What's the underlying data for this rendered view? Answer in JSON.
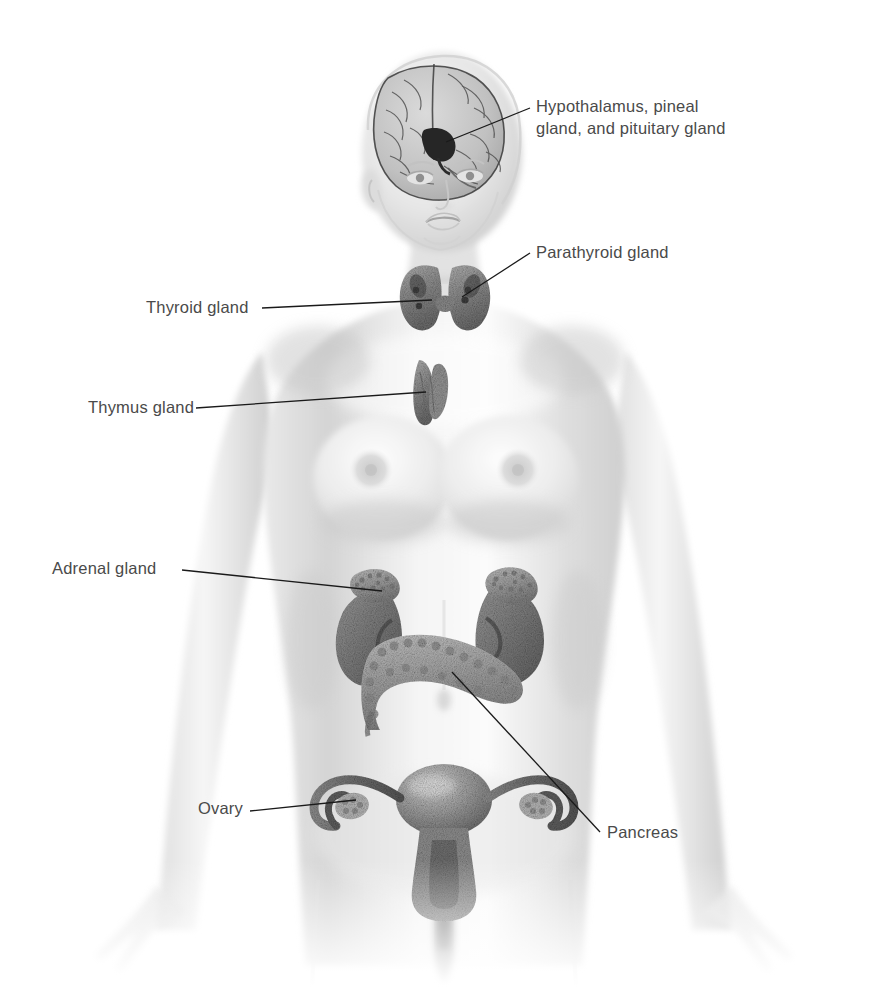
{
  "diagram": {
    "background_color": "#ffffff",
    "label_color": "#4a4a4a",
    "leader_line_color": "#1a1a1a",
    "organ_tint": "#7d7d7d",
    "body_tint": "#d9d9d9"
  },
  "labels": {
    "hypothalamus": "Hypothalamus, pineal\ngland, and pituitary gland",
    "parathyroid": "Parathyroid gland",
    "thyroid": "Thyroid gland",
    "thymus": "Thymus gland",
    "adrenal": "Adrenal gland",
    "ovary": "Ovary",
    "pancreas": "Pancreas"
  },
  "structures": [
    {
      "name": "brain",
      "label_key": "hypothalamus"
    },
    {
      "name": "thyroid-gland",
      "label_key": "thyroid"
    },
    {
      "name": "parathyroid-gland",
      "label_key": "parathyroid"
    },
    {
      "name": "thymus-gland",
      "label_key": "thymus"
    },
    {
      "name": "adrenal-gland",
      "label_key": "adrenal"
    },
    {
      "name": "pancreas",
      "label_key": "pancreas"
    },
    {
      "name": "ovary",
      "label_key": "ovary"
    },
    {
      "name": "kidney",
      "label_key": null
    },
    {
      "name": "uterus",
      "label_key": null
    },
    {
      "name": "fallopian-tube",
      "label_key": null
    }
  ]
}
